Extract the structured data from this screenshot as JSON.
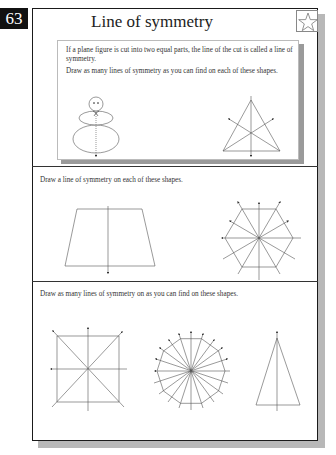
{
  "page": {
    "number": "63",
    "title": "Line of symmetry",
    "badge_icon": "star-icon"
  },
  "info": {
    "definition": "If a plane figure is cut into two equal parts, the line of the cut is called a line of symmetry.",
    "example_instruction": "Draw as many lines of symmetry as you can find on each of these shapes.",
    "example_shapes": [
      "snowman",
      "equilateral-triangle"
    ]
  },
  "sections": [
    {
      "prompt": "Draw a line of symmetry on each of these shapes.",
      "shapes": [
        "trapezoid",
        "hexagon"
      ]
    },
    {
      "prompt": "Draw as many lines of symmetry on as you can find on these shapes.",
      "shapes": [
        "square",
        "decagon",
        "isosceles-triangle"
      ]
    }
  ],
  "colors": {
    "badge_bg": "#111111",
    "frame_border": "#1a1a1a",
    "shadow": "#b8b8b8",
    "line": "#555555"
  }
}
